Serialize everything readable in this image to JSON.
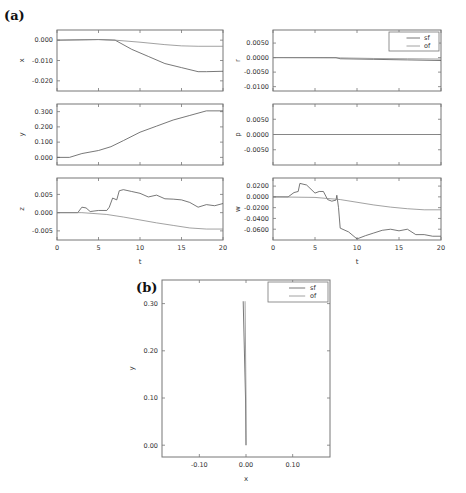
{
  "figure": {
    "panel_a_label": "(a)",
    "panel_b_label": "(b)"
  },
  "chart_data": [
    {
      "id": "x",
      "type": "line",
      "panel": "a",
      "ylabel": "x",
      "xlabel": "",
      "xlim": [
        0,
        20
      ],
      "ylim": [
        -0.025,
        0.005
      ],
      "yticks": [
        0.0,
        -0.01,
        -0.02
      ],
      "ytick_labels": [
        "0.000",
        "-0.010",
        "-0.020"
      ],
      "xticks": [
        0,
        5,
        10,
        15,
        20
      ],
      "show_xtick_labels": false,
      "series": [
        {
          "name": "sf",
          "x": [
            0,
            5,
            7,
            9,
            11,
            13,
            15,
            17,
            18,
            20
          ],
          "y": [
            0,
            0.0003,
            0,
            -0.0045,
            -0.008,
            -0.0115,
            -0.0135,
            -0.0155,
            -0.0155,
            -0.0153
          ]
        },
        {
          "name": "of",
          "x": [
            0,
            5,
            7,
            10,
            13,
            15,
            17,
            20
          ],
          "y": [
            0,
            0.0003,
            0,
            -0.001,
            -0.0022,
            -0.0028,
            -0.003,
            -0.003
          ]
        }
      ]
    },
    {
      "id": "y",
      "type": "line",
      "panel": "a",
      "ylabel": "y",
      "xlabel": "",
      "xlim": [
        0,
        20
      ],
      "ylim": [
        -0.05,
        0.35
      ],
      "yticks": [
        0.3,
        0.2,
        0.1,
        0.0
      ],
      "ytick_labels": [
        "0.300",
        "0.200",
        "0.100",
        "0.000"
      ],
      "xticks": [
        0,
        5,
        10,
        15,
        20
      ],
      "show_xtick_labels": false,
      "series": [
        {
          "name": "sf",
          "x": [
            0,
            1.5,
            3,
            5,
            6.5,
            8,
            10,
            12,
            14,
            16,
            18,
            20
          ],
          "y": [
            0,
            0,
            0.025,
            0.045,
            0.07,
            0.11,
            0.165,
            0.205,
            0.245,
            0.275,
            0.305,
            0.305
          ]
        }
      ]
    },
    {
      "id": "z",
      "type": "line",
      "panel": "a",
      "ylabel": "z",
      "xlabel": "t",
      "xlim": [
        0,
        20
      ],
      "ylim": [
        -0.0075,
        0.0095
      ],
      "yticks": [
        0.005,
        0.0,
        -0.005
      ],
      "ytick_labels": [
        "0.005",
        "0.000",
        "-0.005"
      ],
      "xticks": [
        0,
        5,
        10,
        15,
        20
      ],
      "xtick_labels": [
        "0",
        "5",
        "10",
        "15",
        "20"
      ],
      "show_xtick_labels": true,
      "series": [
        {
          "name": "sf",
          "x": [
            0,
            2.5,
            3,
            3.5,
            4,
            5,
            6,
            6.3,
            6.7,
            7.2,
            7.5,
            8,
            9,
            10,
            11,
            12,
            13,
            14,
            15,
            16,
            17,
            18,
            19,
            20
          ],
          "y": [
            0,
            0,
            0.0015,
            0.0013,
            0.0003,
            0.0006,
            0.0006,
            0.0015,
            0.004,
            0.0035,
            0.006,
            0.0063,
            0.0058,
            0.0053,
            0.0043,
            0.0048,
            0.0038,
            0.0037,
            0.0035,
            0.0028,
            0.0015,
            0.0022,
            0.0019,
            0.0025
          ]
        },
        {
          "name": "of",
          "x": [
            0,
            3,
            6,
            8,
            10,
            12,
            14,
            16,
            18,
            20
          ],
          "y": [
            0,
            0,
            -0.0005,
            -0.0012,
            -0.002,
            -0.0028,
            -0.0035,
            -0.0042,
            -0.0045,
            -0.0045
          ]
        }
      ]
    },
    {
      "id": "r",
      "type": "line",
      "panel": "a",
      "ylabel": "r",
      "xlabel": "",
      "xlim": [
        0,
        20
      ],
      "ylim": [
        -0.0115,
        0.0095
      ],
      "yticks": [
        0.005,
        0.0,
        -0.005,
        -0.01
      ],
      "ytick_labels": [
        "0.0050",
        "0.0000",
        "-0.0050",
        "-0.0100"
      ],
      "xticks": [
        0,
        5,
        10,
        15,
        20
      ],
      "show_xtick_labels": false,
      "legend": {
        "entries": [
          "sf",
          "of"
        ],
        "position": "upper right"
      },
      "series": [
        {
          "name": "sf",
          "x": [
            0,
            7.5,
            8,
            12,
            16,
            20
          ],
          "y": [
            0,
            0,
            -0.0004,
            -0.0006,
            -0.0008,
            -0.001
          ]
        },
        {
          "name": "of",
          "x": [
            0,
            8,
            12,
            16,
            20
          ],
          "y": [
            0,
            -0.0001,
            -0.0003,
            -0.0004,
            -0.0005
          ]
        }
      ]
    },
    {
      "id": "p",
      "type": "line",
      "panel": "a",
      "ylabel": "p",
      "xlabel": "",
      "xlim": [
        0,
        20
      ],
      "ylim": [
        -0.01,
        0.01
      ],
      "yticks": [
        0.005,
        0.0,
        -0.005
      ],
      "ytick_labels": [
        "0.0050",
        "0.0000",
        "-0.0050"
      ],
      "xticks": [
        0,
        5,
        10,
        15,
        20
      ],
      "show_xtick_labels": false,
      "series": [
        {
          "name": "sf",
          "x": [
            0,
            20
          ],
          "y": [
            0,
            0
          ]
        },
        {
          "name": "of",
          "x": [
            0,
            20
          ],
          "y": [
            0,
            0
          ]
        }
      ]
    },
    {
      "id": "w",
      "type": "line",
      "panel": "a",
      "ylabel": "w",
      "xlabel": "t",
      "xlim": [
        0,
        20
      ],
      "ylim": [
        -0.08,
        0.035
      ],
      "yticks": [
        0.02,
        0.0,
        -0.02,
        -0.04,
        -0.06
      ],
      "ytick_labels": [
        "0.0200",
        "0.0000",
        "-0.0200",
        "-0.0400",
        "-0.0600"
      ],
      "xticks": [
        0,
        5,
        10,
        15,
        20
      ],
      "xtick_labels": [
        "0",
        "5",
        "10",
        "15",
        "20"
      ],
      "show_xtick_labels": true,
      "series": [
        {
          "name": "sf",
          "x": [
            0,
            1.8,
            2.5,
            3,
            3.2,
            4,
            5,
            5.5,
            6,
            6.5,
            7,
            7.5,
            7.6,
            7.8,
            8,
            9,
            10,
            11,
            12,
            13,
            14,
            15,
            16,
            17,
            18,
            19,
            20
          ],
          "y": [
            0,
            0,
            0.008,
            0.01,
            0.025,
            0.022,
            0.007,
            0.01,
            0.01,
            -0.005,
            -0.008,
            -0.006,
            0.003,
            -0.02,
            -0.058,
            -0.065,
            -0.078,
            -0.072,
            -0.067,
            -0.062,
            -0.06,
            -0.063,
            -0.06,
            -0.07,
            -0.07,
            -0.073,
            -0.073
          ]
        },
        {
          "name": "of",
          "x": [
            0,
            5,
            8,
            10,
            12,
            14,
            16,
            18,
            20
          ],
          "y": [
            0,
            -0.001,
            -0.005,
            -0.01,
            -0.015,
            -0.019,
            -0.022,
            -0.024,
            -0.024
          ]
        }
      ]
    },
    {
      "id": "xy",
      "type": "line",
      "panel": "b",
      "xlabel": "x",
      "ylabel": "y",
      "xlim": [
        -0.18,
        0.18
      ],
      "ylim": [
        -0.025,
        0.35
      ],
      "xticks": [
        -0.1,
        0.0,
        0.1
      ],
      "xtick_labels": [
        "-0.10",
        "0.00",
        "0.10"
      ],
      "yticks": [
        0.0,
        0.1,
        0.2,
        0.3
      ],
      "ytick_labels": [
        "0.00",
        "0.10",
        "0.20",
        "0.30"
      ],
      "legend": {
        "entries": [
          "sf",
          "of"
        ],
        "position": "upper right"
      },
      "series": [
        {
          "name": "sf",
          "x": [
            0.0,
            -0.001,
            -0.006
          ],
          "y": [
            0.0,
            0.1,
            0.305
          ]
        },
        {
          "name": "of",
          "x": [
            0.0,
            0.0,
            -0.002
          ],
          "y": [
            0.0,
            0.1,
            0.305
          ]
        }
      ]
    }
  ]
}
